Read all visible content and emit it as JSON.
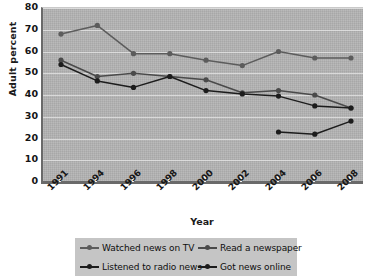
{
  "chart_data": {
    "type": "line",
    "title": "",
    "xlabel": "Year",
    "ylabel": "Adult percent",
    "categories": [
      "1991",
      "1994",
      "1996",
      "1998",
      "2000",
      "2002",
      "2004",
      "2006",
      "2008"
    ],
    "ylim": [
      0,
      80
    ],
    "yticks": [
      0,
      10,
      20,
      30,
      40,
      50,
      60,
      70,
      80
    ],
    "grid": true,
    "legend_position": "bottom",
    "series": [
      {
        "name": "Watched news on TV",
        "color": "#5c5c5c",
        "values": [
          68,
          72,
          59,
          59,
          56,
          53.5,
          60,
          57,
          57
        ]
      },
      {
        "name": "Read a newspaper",
        "color": "#4a4a4a",
        "values": [
          56,
          48.5,
          50,
          48.5,
          47,
          41,
          42,
          40,
          34
        ]
      },
      {
        "name": "Listened to radio news",
        "color": "#1c1c1c",
        "values": [
          54,
          46.5,
          43.5,
          48.5,
          42,
          40.5,
          39.5,
          35,
          34
        ]
      },
      {
        "name": "Got news online",
        "color": "#1c1c1c",
        "values": [
          null,
          null,
          null,
          null,
          null,
          null,
          23,
          22,
          28
        ]
      }
    ]
  },
  "legend": {
    "items": [
      {
        "label": "Watched news on TV",
        "color": "#5c5c5c"
      },
      {
        "label": "Read a newspaper",
        "color": "#4a4a4a"
      },
      {
        "label": "Listened to radio news",
        "color": "#1c1c1c"
      },
      {
        "label": "Got news online",
        "color": "#1c1c1c"
      }
    ]
  },
  "colors": {
    "plot_background": "#b3b3b3",
    "gridline": "#e2e2e2",
    "axis": "#6a6a6a",
    "legend_background": "#c5c5c5",
    "page_background": "#ffffff"
  }
}
